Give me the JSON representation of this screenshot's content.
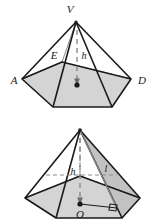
{
  "figure": {
    "colors": {
      "stroke": "#1a1a1a",
      "base_fill": "#d4d4d4",
      "face_fill": "#c9c9c9",
      "hidden_stroke": "#8a8a8a",
      "background": "#ffffff"
    }
  },
  "upper_figure": {
    "name": "pentagonal-pyramid-labeled",
    "labels": {
      "apex": "V",
      "vertex_a": "A",
      "vertex_b": "B",
      "vertex_c": "C",
      "vertex_d": "D",
      "vertex_e": "E",
      "height": "h"
    }
  },
  "lower_figure": {
    "name": "pentagonal-pyramid-height-slant",
    "labels": {
      "center": "O",
      "height": "h",
      "slant_height": "l"
    }
  }
}
